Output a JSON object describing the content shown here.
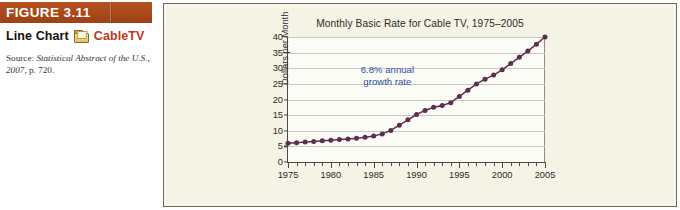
{
  "caption": {
    "figure_label": "FIGURE 3.11",
    "kind_label": "Line Chart",
    "dataset_name": "CableTV",
    "folder_icon": "folder-icon",
    "source_prefix": "Source: ",
    "source_italic": "Statistical Abstract of the U.S., 2007,",
    "source_suffix": " p. 720."
  },
  "colors": {
    "header_bar": "#a9481a",
    "dataset_red": "#c0371f",
    "panel_bg": "#f4f3e5",
    "plot_bg": "#fcfcf6",
    "series": "#5d2f4f",
    "annotation": "#2c4fa3",
    "gridline": "#c9c9c4",
    "axis": "#4a4a4a"
  },
  "chart_data": {
    "type": "line",
    "title": "Monthly Basic Rate for Cable TV, 1975–2005",
    "xlabel": "",
    "ylabel": "Dollars per Month",
    "xlim": [
      1975,
      2005
    ],
    "ylim": [
      0,
      40
    ],
    "yticks": [
      0,
      5,
      10,
      15,
      20,
      25,
      30,
      35,
      40
    ],
    "xticks": [
      1975,
      1980,
      1985,
      1990,
      1995,
      2000,
      2005
    ],
    "xtick_minor_step": 1,
    "grid": "horizontal",
    "legend": "none",
    "annotations": [
      {
        "text_line1": "6.8% annual",
        "text_line2": "growth rate",
        "x": 1986.6,
        "y": 27.5
      }
    ],
    "series": [
      {
        "name": "Monthly basic rate",
        "marker": "circle",
        "x": [
          1975,
          1976,
          1977,
          1978,
          1979,
          1980,
          1981,
          1982,
          1983,
          1984,
          1985,
          1986,
          1987,
          1988,
          1989,
          1990,
          1991,
          1992,
          1993,
          1994,
          1995,
          1996,
          1997,
          1998,
          1999,
          2000,
          2001,
          2002,
          2003,
          2004,
          2005
        ],
        "values": [
          6.0,
          6.2,
          6.4,
          6.6,
          6.8,
          7.0,
          7.2,
          7.4,
          7.6,
          7.9,
          8.3,
          9.0,
          10.1,
          11.8,
          13.5,
          15.2,
          16.5,
          17.5,
          18.1,
          19.0,
          21.0,
          23.0,
          25.0,
          26.5,
          27.8,
          29.5,
          31.5,
          33.5,
          35.5,
          37.7,
          40.0
        ]
      }
    ]
  }
}
